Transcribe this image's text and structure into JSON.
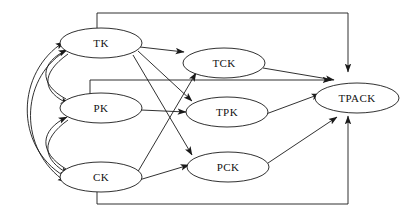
{
  "diagram": {
    "type": "directed-graph",
    "background_color": "#ffffff",
    "stroke_color": "#1a1a1a",
    "text_color": "#111111",
    "nodes": [
      {
        "id": "TK",
        "label": "TK",
        "cx": 101,
        "cy": 43,
        "rx": 41,
        "ry": 15
      },
      {
        "id": "PK",
        "label": "PK",
        "cx": 101,
        "cy": 108,
        "rx": 41,
        "ry": 15
      },
      {
        "id": "CK",
        "label": "CK",
        "cx": 101,
        "cy": 177,
        "rx": 41,
        "ry": 15
      },
      {
        "id": "TCK",
        "label": "TCK",
        "cx": 224,
        "cy": 63,
        "rx": 41,
        "ry": 15
      },
      {
        "id": "TPK",
        "label": "TPK",
        "cx": 227,
        "cy": 112,
        "rx": 41,
        "ry": 15
      },
      {
        "id": "PCK",
        "label": "PCK",
        "cx": 228,
        "cy": 167,
        "rx": 41,
        "ry": 15
      },
      {
        "id": "TPACK",
        "label": "TPACK",
        "cx": 357,
        "cy": 98,
        "rx": 42,
        "ry": 15
      }
    ],
    "edges": [
      {
        "from": "TK",
        "to": "PK",
        "style": "curve-left-bidirectional"
      },
      {
        "from": "TK",
        "to": "CK",
        "style": "curve-left-bidirectional"
      },
      {
        "from": "PK",
        "to": "CK",
        "style": "curve-left-bidirectional"
      },
      {
        "from": "TK",
        "to": "TCK",
        "style": "straight"
      },
      {
        "from": "TK",
        "to": "TPK",
        "style": "straight-diagonal"
      },
      {
        "from": "TK",
        "to": "PCK",
        "style": "straight-diagonal"
      },
      {
        "from": "PK",
        "to": "TPK",
        "style": "straight"
      },
      {
        "from": "CK",
        "to": "TCK",
        "style": "straight-diagonal"
      },
      {
        "from": "CK",
        "to": "PCK",
        "style": "straight"
      },
      {
        "from": "TCK",
        "to": "TPACK",
        "style": "straight-diagonal"
      },
      {
        "from": "TPK",
        "to": "TPACK",
        "style": "straight-diagonal"
      },
      {
        "from": "PCK",
        "to": "TPACK",
        "style": "straight-diagonal"
      },
      {
        "from": "TK",
        "to": "TPACK",
        "style": "orthogonal-top"
      },
      {
        "from": "PK",
        "to": "TPACK",
        "style": "orthogonal-middle"
      },
      {
        "from": "CK",
        "to": "TPACK",
        "style": "orthogonal-bottom"
      }
    ]
  }
}
